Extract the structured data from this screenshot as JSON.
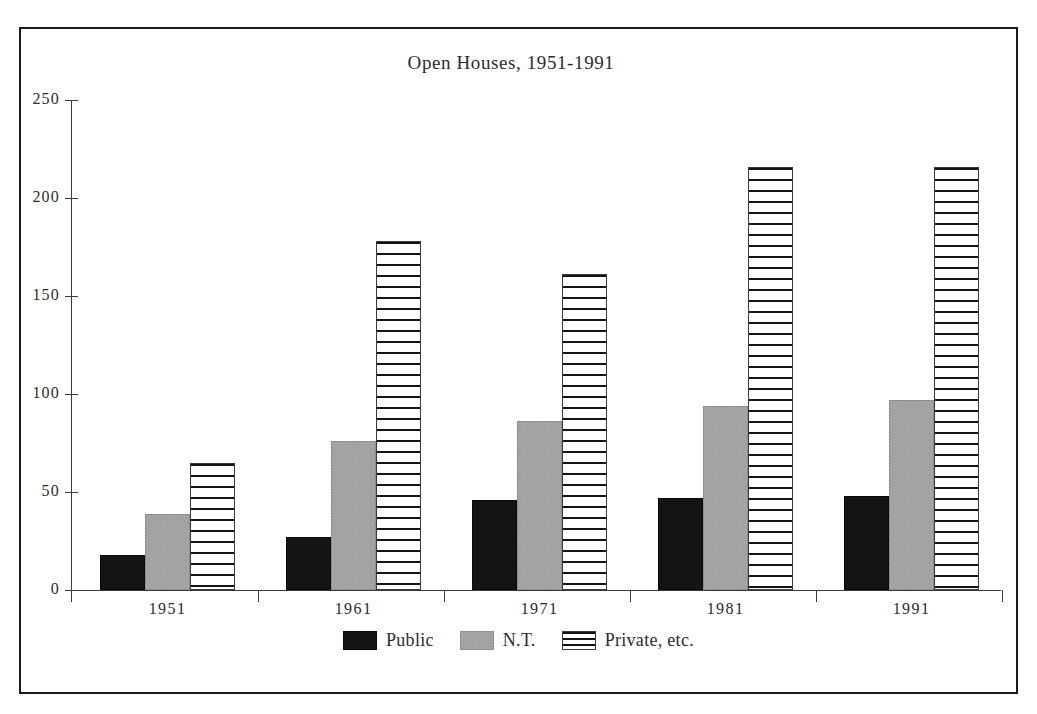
{
  "chart_data": {
    "type": "bar",
    "title": "Open Houses, 1951-1991",
    "xlabel": "",
    "ylabel": "",
    "categories": [
      "1951",
      "1961",
      "1971",
      "1981",
      "1991"
    ],
    "series": [
      {
        "name": "Public",
        "values": [
          18,
          27,
          46,
          47,
          48
        ],
        "color": "#141414",
        "fill": "solid-black"
      },
      {
        "name": "N.T.",
        "values": [
          39,
          76,
          86,
          94,
          97
        ],
        "color": "#a9a9a9",
        "fill": "gray-dither"
      },
      {
        "name": "Private, etc.",
        "values": [
          65,
          178,
          161,
          216,
          216
        ],
        "color": "#ffffff",
        "fill": "horizontal-stripes"
      }
    ],
    "ylim": [
      0,
      250
    ],
    "yticks": [
      0,
      50,
      100,
      150,
      200,
      250
    ],
    "ytick_labels": [
      "0",
      "50",
      "100",
      "150",
      "200",
      "250"
    ],
    "grid": false,
    "legend_position": "bottom-center"
  },
  "legend": {
    "items": [
      {
        "label": "Public",
        "swatch": "solid-black-swatch"
      },
      {
        "label": "N.T.",
        "swatch": "gray-dither-swatch"
      },
      {
        "label": "Private, etc.",
        "swatch": "striped-swatch"
      }
    ]
  }
}
